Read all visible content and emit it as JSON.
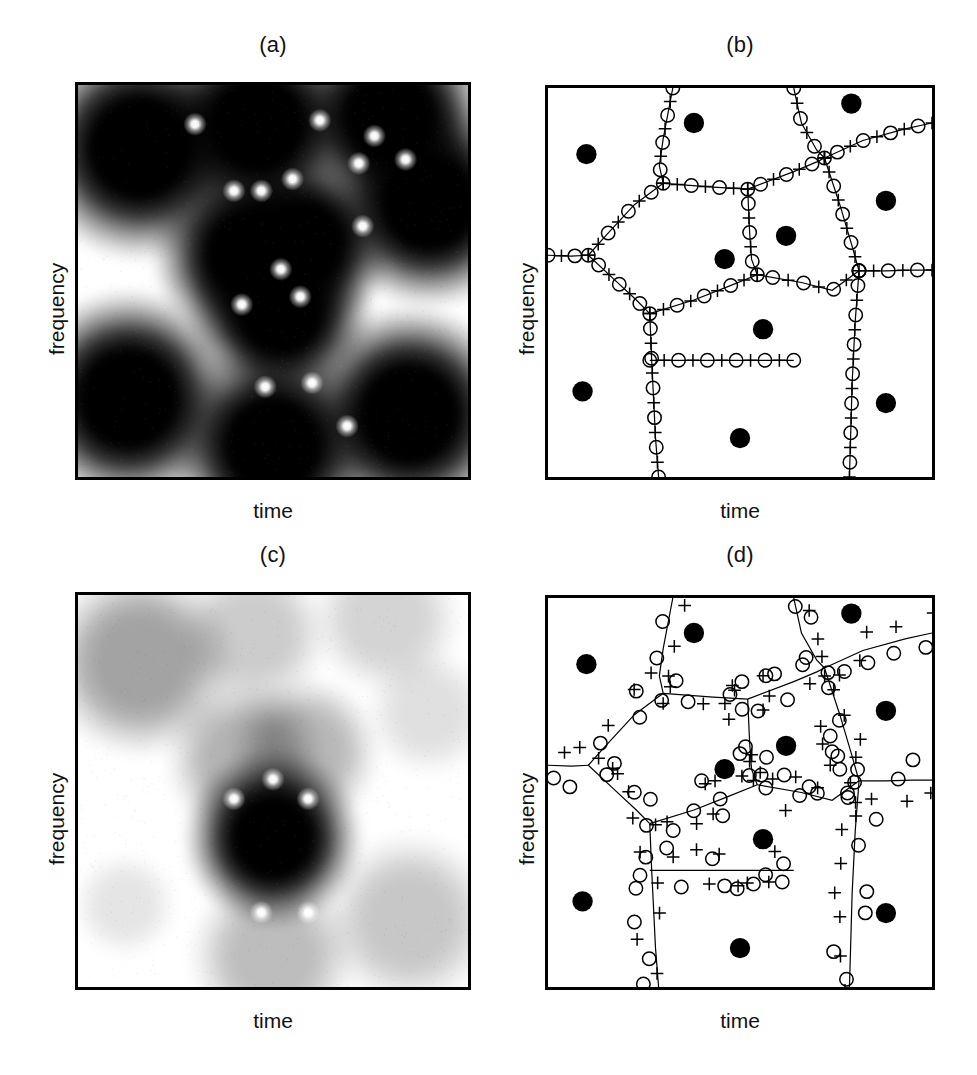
{
  "figure": {
    "width": 977,
    "height": 1075,
    "background": "#ffffff",
    "ink": "#000000"
  },
  "labels": {
    "xlabel": "time",
    "ylabel": "frequency",
    "panel_a": "(a)",
    "panel_b": "(b)",
    "panel_c": "(c)",
    "panel_d": "(d)"
  },
  "panels": [
    {
      "id": "a",
      "letter": "(a)",
      "kind": "field",
      "xlabel": "time",
      "ylabel": "frequency",
      "frame": {
        "x": 75,
        "y": 82,
        "w": 396,
        "h": 398
      },
      "letter_y": 34,
      "xlabel_y": 500,
      "ylabel_x": 46,
      "ylabel_y": 355
    },
    {
      "id": "b",
      "letter": "(b)",
      "kind": "voronoi",
      "xlabel": "time",
      "ylabel": "frequency",
      "frame": {
        "x": 545,
        "y": 85,
        "w": 390,
        "h": 395
      },
      "letter_y": 34,
      "xlabel_y": 500,
      "ylabel_x": 516,
      "ylabel_y": 355
    },
    {
      "id": "c",
      "letter": "(c)",
      "kind": "field",
      "xlabel": "time",
      "ylabel": "frequency",
      "frame": {
        "x": 75,
        "y": 592,
        "w": 396,
        "h": 398
      },
      "letter_y": 544,
      "xlabel_y": 1010,
      "ylabel_x": 46,
      "ylabel_y": 865
    },
    {
      "id": "d",
      "letter": "(d)",
      "kind": "voronoi",
      "xlabel": "time",
      "ylabel": "frequency",
      "frame": {
        "x": 545,
        "y": 595,
        "w": 390,
        "h": 395
      },
      "letter_y": 544,
      "xlabel_y": 1010,
      "ylabel_x": 516,
      "ylabel_y": 865
    }
  ],
  "chart_data": {
    "type": "heatmap",
    "title": "",
    "xlabel": "time",
    "ylabel": "frequency",
    "grid": false,
    "legend": null,
    "axis_ranges": {
      "x": [
        0,
        1
      ],
      "y": [
        0,
        1
      ]
    },
    "marker_legend": [
      {
        "symbol": "filled-disc",
        "glyph": "●",
        "meaning": "Gaussian lattice centre (energy maximum)"
      },
      {
        "symbol": "open-circle",
        "glyph": "○",
        "meaning": "zero / saddle marker"
      },
      {
        "symbol": "plus",
        "glyph": "+",
        "meaning": "critical point marker"
      }
    ],
    "panel_a": {
      "type": "heatmap",
      "colormap": "grey-inverted",
      "value_range": [
        0,
        1
      ],
      "blob_peak": 1.0,
      "blobs": [
        {
          "x": 0.16,
          "y": 0.16,
          "r": 0.145,
          "amp": 1.0
        },
        {
          "x": 0.46,
          "y": 0.1,
          "r": 0.135,
          "amp": 1.0
        },
        {
          "x": 0.8,
          "y": 0.08,
          "r": 0.13,
          "amp": 1.0
        },
        {
          "x": 0.9,
          "y": 0.3,
          "r": 0.135,
          "amp": 1.0
        },
        {
          "x": 0.44,
          "y": 0.43,
          "r": 0.125,
          "amp": 1.0
        },
        {
          "x": 0.58,
          "y": 0.4,
          "r": 0.115,
          "amp": 1.0
        },
        {
          "x": 0.52,
          "y": 0.58,
          "r": 0.12,
          "amp": 1.0
        },
        {
          "x": 0.13,
          "y": 0.8,
          "r": 0.14,
          "amp": 1.0
        },
        {
          "x": 0.5,
          "y": 0.92,
          "r": 0.135,
          "amp": 1.0
        },
        {
          "x": 0.85,
          "y": 0.84,
          "r": 0.14,
          "amp": 1.0
        }
      ],
      "zeros": [
        {
          "x": 0.3,
          "y": 0.1
        },
        {
          "x": 0.62,
          "y": 0.09
        },
        {
          "x": 0.4,
          "y": 0.27
        },
        {
          "x": 0.47,
          "y": 0.27
        },
        {
          "x": 0.55,
          "y": 0.24
        },
        {
          "x": 0.72,
          "y": 0.2
        },
        {
          "x": 0.76,
          "y": 0.13
        },
        {
          "x": 0.84,
          "y": 0.19
        },
        {
          "x": 0.73,
          "y": 0.36
        },
        {
          "x": 0.52,
          "y": 0.47
        },
        {
          "x": 0.42,
          "y": 0.56
        },
        {
          "x": 0.57,
          "y": 0.54
        },
        {
          "x": 0.48,
          "y": 0.77
        },
        {
          "x": 0.6,
          "y": 0.76
        },
        {
          "x": 0.69,
          "y": 0.87
        }
      ]
    },
    "panel_c": {
      "type": "heatmap",
      "colormap": "grey-inverted",
      "value_range": [
        0,
        1
      ],
      "note": "Same lattice as (a) but strongly attenuated: only the central blob reaches full black.",
      "blobs": [
        {
          "x": 0.16,
          "y": 0.17,
          "r": 0.125,
          "amp": 0.36
        },
        {
          "x": 0.45,
          "y": 0.1,
          "r": 0.1,
          "amp": 0.2
        },
        {
          "x": 0.79,
          "y": 0.06,
          "r": 0.1,
          "amp": 0.17
        },
        {
          "x": 0.9,
          "y": 0.3,
          "r": 0.085,
          "amp": 0.12
        },
        {
          "x": 0.43,
          "y": 0.42,
          "r": 0.105,
          "amp": 0.3
        },
        {
          "x": 0.58,
          "y": 0.4,
          "r": 0.1,
          "amp": 0.28
        },
        {
          "x": 0.5,
          "y": 0.62,
          "r": 0.115,
          "amp": 1.0
        },
        {
          "x": 0.12,
          "y": 0.79,
          "r": 0.07,
          "amp": 0.1
        },
        {
          "x": 0.5,
          "y": 0.92,
          "r": 0.11,
          "amp": 0.26
        },
        {
          "x": 0.85,
          "y": 0.83,
          "r": 0.115,
          "amp": 0.22
        }
      ],
      "zeros": [
        {
          "x": 0.5,
          "y": 0.47
        },
        {
          "x": 0.4,
          "y": 0.52
        },
        {
          "x": 0.59,
          "y": 0.52
        },
        {
          "x": 0.47,
          "y": 0.81
        },
        {
          "x": 0.59,
          "y": 0.81
        }
      ]
    },
    "panel_b": {
      "type": "scatter",
      "note": "Markers lie tightly along the Voronoi edges (low-noise case).",
      "discs": [
        {
          "x": 0.1,
          "y": 0.17
        },
        {
          "x": 0.38,
          "y": 0.09
        },
        {
          "x": 0.79,
          "y": 0.04
        },
        {
          "x": 0.88,
          "y": 0.29
        },
        {
          "x": 0.62,
          "y": 0.38
        },
        {
          "x": 0.46,
          "y": 0.44
        },
        {
          "x": 0.56,
          "y": 0.62
        },
        {
          "x": 0.09,
          "y": 0.78
        },
        {
          "x": 0.5,
          "y": 0.9
        },
        {
          "x": 0.88,
          "y": 0.81
        }
      ],
      "edges": [
        [
          [
            0.325,
            0.0
          ],
          [
            0.3,
            0.13
          ],
          [
            0.29,
            0.2
          ],
          [
            0.3,
            0.245
          ]
        ],
        [
          [
            0.3,
            0.245
          ],
          [
            0.225,
            0.3
          ],
          [
            0.15,
            0.38
          ],
          [
            0.105,
            0.43
          ]
        ],
        [
          [
            0.3,
            0.245
          ],
          [
            0.43,
            0.255
          ],
          [
            0.52,
            0.26
          ]
        ],
        [
          [
            0.52,
            0.26
          ],
          [
            0.64,
            0.215
          ],
          [
            0.7,
            0.19
          ],
          [
            0.72,
            0.18
          ]
        ],
        [
          [
            0.64,
            0.0
          ],
          [
            0.66,
            0.09
          ],
          [
            0.7,
            0.16
          ],
          [
            0.72,
            0.18
          ]
        ],
        [
          [
            0.72,
            0.18
          ],
          [
            0.82,
            0.135
          ],
          [
            0.93,
            0.105
          ],
          [
            1.0,
            0.09
          ]
        ],
        [
          [
            0.72,
            0.18
          ],
          [
            0.76,
            0.3
          ],
          [
            0.79,
            0.4
          ],
          [
            0.81,
            0.47
          ]
        ],
        [
          [
            0.52,
            0.26
          ],
          [
            0.525,
            0.37
          ],
          [
            0.53,
            0.44
          ],
          [
            0.545,
            0.48
          ]
        ],
        [
          [
            0.0,
            0.43
          ],
          [
            0.06,
            0.432
          ],
          [
            0.105,
            0.43
          ]
        ],
        [
          [
            0.105,
            0.43
          ],
          [
            0.17,
            0.49
          ],
          [
            0.23,
            0.545
          ],
          [
            0.265,
            0.58
          ]
        ],
        [
          [
            0.265,
            0.58
          ],
          [
            0.38,
            0.545
          ],
          [
            0.47,
            0.51
          ],
          [
            0.545,
            0.48
          ]
        ],
        [
          [
            0.545,
            0.48
          ],
          [
            0.66,
            0.5
          ],
          [
            0.74,
            0.52
          ],
          [
            0.81,
            0.47
          ]
        ],
        [
          [
            0.81,
            0.47
          ],
          [
            0.88,
            0.47
          ],
          [
            0.95,
            0.468
          ],
          [
            1.0,
            0.468
          ]
        ],
        [
          [
            0.265,
            0.58
          ],
          [
            0.27,
            0.7
          ],
          [
            0.275,
            0.8
          ],
          [
            0.28,
            0.9
          ],
          [
            0.288,
            1.0
          ]
        ],
        [
          [
            0.265,
            0.7
          ],
          [
            0.4,
            0.7
          ],
          [
            0.53,
            0.7
          ],
          [
            0.64,
            0.7
          ]
        ],
        [
          [
            0.81,
            0.47
          ],
          [
            0.8,
            0.6
          ],
          [
            0.792,
            0.76
          ],
          [
            0.788,
            0.9
          ],
          [
            0.785,
            1.0
          ]
        ]
      ],
      "markers_per_edge": "alternating open-circle and plus, evenly spaced",
      "marker_jitter": 0.0
    },
    "panel_d": {
      "type": "scatter",
      "note": "Same lattice and tessellation as (b), but markers are noise-perturbed and scatter away from the edges, especially in the low-energy interior cells.",
      "discs": [
        {
          "x": 0.1,
          "y": 0.17
        },
        {
          "x": 0.38,
          "y": 0.09
        },
        {
          "x": 0.79,
          "y": 0.04
        },
        {
          "x": 0.88,
          "y": 0.29
        },
        {
          "x": 0.62,
          "y": 0.38
        },
        {
          "x": 0.46,
          "y": 0.44
        },
        {
          "x": 0.56,
          "y": 0.62
        },
        {
          "x": 0.09,
          "y": 0.78
        },
        {
          "x": 0.5,
          "y": 0.9
        },
        {
          "x": 0.88,
          "y": 0.81
        }
      ],
      "edges": [
        [
          [
            0.325,
            0.0
          ],
          [
            0.3,
            0.13
          ],
          [
            0.29,
            0.2
          ],
          [
            0.3,
            0.245
          ]
        ],
        [
          [
            0.3,
            0.245
          ],
          [
            0.225,
            0.3
          ],
          [
            0.15,
            0.38
          ],
          [
            0.105,
            0.43
          ]
        ],
        [
          [
            0.3,
            0.245
          ],
          [
            0.43,
            0.255
          ],
          [
            0.52,
            0.26
          ]
        ],
        [
          [
            0.52,
            0.26
          ],
          [
            0.64,
            0.215
          ],
          [
            0.7,
            0.19
          ],
          [
            0.72,
            0.18
          ]
        ],
        [
          [
            0.64,
            0.0
          ],
          [
            0.66,
            0.09
          ],
          [
            0.7,
            0.16
          ],
          [
            0.72,
            0.18
          ]
        ],
        [
          [
            0.72,
            0.18
          ],
          [
            0.82,
            0.135
          ],
          [
            0.93,
            0.105
          ],
          [
            1.0,
            0.09
          ]
        ],
        [
          [
            0.72,
            0.18
          ],
          [
            0.76,
            0.3
          ],
          [
            0.79,
            0.4
          ],
          [
            0.81,
            0.47
          ]
        ],
        [
          [
            0.52,
            0.26
          ],
          [
            0.525,
            0.37
          ],
          [
            0.53,
            0.44
          ],
          [
            0.545,
            0.48
          ]
        ],
        [
          [
            0.0,
            0.43
          ],
          [
            0.06,
            0.432
          ],
          [
            0.105,
            0.43
          ]
        ],
        [
          [
            0.105,
            0.43
          ],
          [
            0.17,
            0.49
          ],
          [
            0.23,
            0.545
          ],
          [
            0.265,
            0.58
          ]
        ],
        [
          [
            0.265,
            0.58
          ],
          [
            0.38,
            0.545
          ],
          [
            0.47,
            0.51
          ],
          [
            0.545,
            0.48
          ]
        ],
        [
          [
            0.545,
            0.48
          ],
          [
            0.66,
            0.5
          ],
          [
            0.74,
            0.52
          ],
          [
            0.81,
            0.47
          ]
        ],
        [
          [
            0.81,
            0.47
          ],
          [
            0.88,
            0.47
          ],
          [
            0.95,
            0.468
          ],
          [
            1.0,
            0.468
          ]
        ],
        [
          [
            0.265,
            0.58
          ],
          [
            0.27,
            0.7
          ],
          [
            0.275,
            0.8
          ],
          [
            0.28,
            0.9
          ],
          [
            0.288,
            1.0
          ]
        ],
        [
          [
            0.265,
            0.7
          ],
          [
            0.4,
            0.7
          ],
          [
            0.53,
            0.7
          ],
          [
            0.64,
            0.7
          ]
        ],
        [
          [
            0.81,
            0.47
          ],
          [
            0.8,
            0.6
          ],
          [
            0.792,
            0.76
          ],
          [
            0.788,
            0.9
          ],
          [
            0.785,
            1.0
          ]
        ]
      ],
      "markers_per_edge": "alternating open-circle and plus, scattered off the edges",
      "marker_jitter": 0.055
    }
  }
}
